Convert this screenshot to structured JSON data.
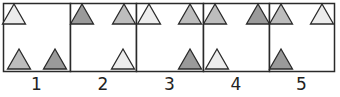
{
  "figure": {
    "colors": {
      "light": "#ececec",
      "medium": "#bdbdbd",
      "dark": "#9a9a9a",
      "stroke": "#2a2a2a"
    },
    "panels": [
      {
        "label": "1",
        "x": 3,
        "w": 67,
        "triangles": [
          {
            "pos": "top-left",
            "cx": 14,
            "cy": 14,
            "shade": "light"
          },
          {
            "pos": "bottom-left",
            "cx": 19,
            "cy": 59,
            "shade": "medium"
          },
          {
            "pos": "bottom-right",
            "cx": 55,
            "cy": 59,
            "shade": "dark"
          }
        ]
      },
      {
        "label": "2",
        "x": 70,
        "w": 66,
        "triangles": [
          {
            "pos": "top-left",
            "cx": 82,
            "cy": 14,
            "shade": "dark"
          },
          {
            "pos": "top-right",
            "cx": 124,
            "cy": 14,
            "shade": "medium"
          },
          {
            "pos": "bottom-right",
            "cx": 123,
            "cy": 59,
            "shade": "light"
          }
        ]
      },
      {
        "label": "3",
        "x": 136,
        "w": 67,
        "triangles": [
          {
            "pos": "top-left",
            "cx": 149,
            "cy": 14,
            "shade": "light"
          },
          {
            "pos": "top-right",
            "cx": 190,
            "cy": 14,
            "shade": "medium"
          },
          {
            "pos": "bottom-right",
            "cx": 190,
            "cy": 59,
            "shade": "dark"
          }
        ]
      },
      {
        "label": "4",
        "x": 203,
        "w": 66,
        "triangles": [
          {
            "pos": "top-left",
            "cx": 215,
            "cy": 14,
            "shade": "medium"
          },
          {
            "pos": "top-right",
            "cx": 258,
            "cy": 14,
            "shade": "dark"
          },
          {
            "pos": "bottom-left",
            "cx": 217,
            "cy": 59,
            "shade": "light"
          }
        ]
      },
      {
        "label": "5",
        "x": 269,
        "w": 65,
        "triangles": [
          {
            "pos": "top-left",
            "cx": 281,
            "cy": 14,
            "shade": "medium"
          },
          {
            "pos": "top-right",
            "cx": 322,
            "cy": 14,
            "shade": "light"
          },
          {
            "pos": "bottom-left",
            "cx": 281,
            "cy": 59,
            "shade": "dark"
          }
        ]
      }
    ]
  }
}
